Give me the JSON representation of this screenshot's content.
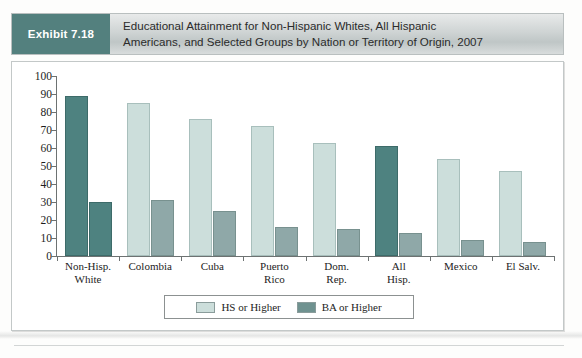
{
  "header": {
    "exhibit_label": "Exhibit 7.18",
    "title": "Educational Attainment for Non-Hispanic Whites, All Hispanic Americans, and Selected Groups by Nation or Territory of Origin, 2007",
    "title_line1": "Educational Attainment for Non-Hispanic Whites, All Hispanic",
    "title_line2": "Americans, and Selected Groups by Nation or Territory of Origin, 2007"
  },
  "colors": {
    "exhibit_tag_bg": "#53807e",
    "series_hs_light": "#ccdedb",
    "series_dark_teal": "#4e8280",
    "series_ba_mid": "#8fa8a8",
    "axis": "#6d7272",
    "frame_border": "#c3c8c8"
  },
  "chart_data": {
    "type": "bar",
    "title": "Educational Attainment for Non-Hispanic Whites, All Hispanic Americans, and Selected Groups by Nation or Territory of Origin, 2007",
    "xlabel": "",
    "ylabel": "",
    "ylim": [
      0,
      100
    ],
    "yticks": [
      0,
      10,
      20,
      30,
      40,
      50,
      60,
      70,
      80,
      90,
      100
    ],
    "grid": false,
    "legend_position": "bottom-center",
    "categories": [
      "Non-Hisp. White",
      "Colombia",
      "Cuba",
      "Puerto Rico",
      "Dom. Rep.",
      "All Hisp.",
      "Mexico",
      "El Salv."
    ],
    "category_lines": [
      [
        "Non-Hisp.",
        "White"
      ],
      [
        "Colombia",
        ""
      ],
      [
        "Cuba",
        ""
      ],
      [
        "Puerto",
        "Rico"
      ],
      [
        "Dom.",
        "Rep."
      ],
      [
        "All",
        "Hisp."
      ],
      [
        "Mexico",
        ""
      ],
      [
        "El Salv.",
        ""
      ]
    ],
    "series": [
      {
        "name": "HS or Higher",
        "values": [
          89,
          85,
          76,
          72,
          63,
          61,
          54,
          47
        ],
        "bar_styles": [
          "hs-dark",
          "hs-light",
          "hs-light",
          "hs-light",
          "hs-light",
          "hs-dark",
          "hs-light",
          "hs-light"
        ]
      },
      {
        "name": "BA or Higher",
        "values": [
          30,
          31,
          25,
          16,
          15,
          13,
          9,
          8
        ],
        "bar_styles": [
          "ba-dark",
          "ba-mid",
          "ba-mid",
          "ba-mid",
          "ba-mid",
          "ba-mid",
          "ba-mid",
          "ba-mid"
        ]
      }
    ]
  },
  "legend": {
    "items": [
      {
        "label": "HS or Higher",
        "swatch": "light"
      },
      {
        "label": "BA or Higher",
        "swatch": "dark"
      }
    ]
  },
  "footer": {
    "text": ""
  }
}
